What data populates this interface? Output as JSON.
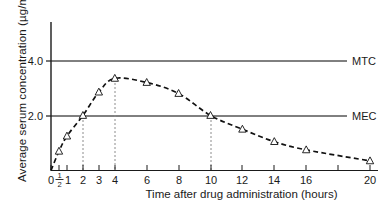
{
  "chart_data": {
    "type": "line",
    "title": "",
    "xlabel": "Time after drug administration (hours)",
    "ylabel": "Average serum concentration (µg/mL)",
    "xlim": [
      0,
      20
    ],
    "ylim": [
      0,
      4.8
    ],
    "grid": false,
    "legend": "none",
    "marker": "open-triangle",
    "linestyle": "dashed",
    "x": [
      0,
      0.5,
      1,
      2,
      3,
      4,
      6,
      8,
      10,
      12,
      14,
      16,
      20
    ],
    "values": [
      0.0,
      0.7,
      1.25,
      2.0,
      2.85,
      3.35,
      3.2,
      2.8,
      2.0,
      1.5,
      1.05,
      0.75,
      0.35
    ],
    "series": [
      {
        "name": "Average serum concentration",
        "values": [
          0.0,
          0.7,
          1.25,
          2.0,
          2.85,
          3.35,
          3.2,
          2.8,
          2.0,
          1.5,
          1.05,
          0.75,
          0.35
        ]
      }
    ],
    "xticks": [
      "0",
      "½",
      "1",
      "2",
      "3",
      "4",
      "6",
      "8",
      "10",
      "12",
      "14",
      "16",
      "18",
      "20"
    ],
    "xtick_values": [
      0,
      0.5,
      1,
      2,
      3,
      4,
      6,
      8,
      10,
      12,
      14,
      16,
      18,
      20
    ],
    "xtick_labeled": [
      true,
      true,
      true,
      true,
      true,
      true,
      true,
      true,
      true,
      true,
      true,
      true,
      false,
      true
    ],
    "yticks": [
      "2.0",
      "4.0"
    ],
    "ytick_values": [
      2.0,
      4.0
    ],
    "half_fraction": {
      "numerator": "1",
      "denominator": "2"
    },
    "threshold_lines": [
      {
        "name": "MTC",
        "label": "MTC",
        "value": 4.0,
        "color": "#000000"
      },
      {
        "name": "MEC",
        "label": "MEC",
        "value": 2.0,
        "color": "#000000"
      }
    ],
    "drop_lines": [
      {
        "x": 2,
        "y": 2.0
      },
      {
        "x": 4,
        "y": 3.35
      },
      {
        "x": 10,
        "y": 2.0
      }
    ],
    "annotations": []
  },
  "colors": {
    "axis": "#1a1a1a",
    "curve": "#111111",
    "threshold": "#000000",
    "dropline": "#8c8c8c",
    "marker_fill": "#ffffff",
    "background": "#ffffff"
  }
}
